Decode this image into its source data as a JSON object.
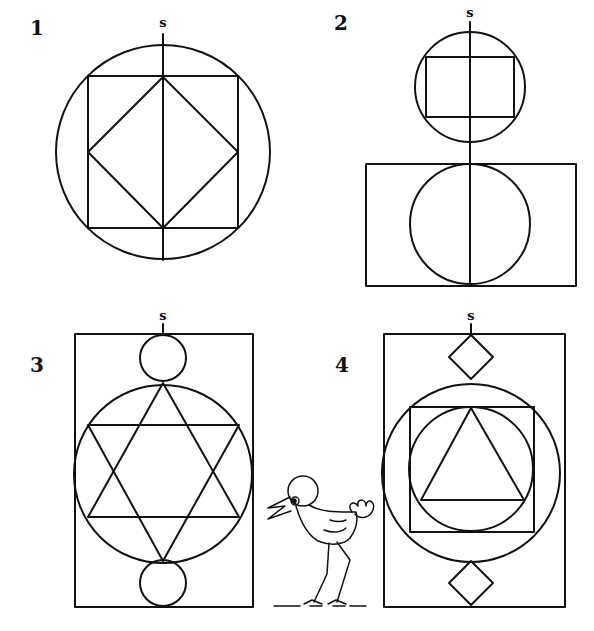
{
  "figures": [
    {
      "number": "1",
      "axis_label": "s",
      "number_pos": [
        30,
        35
      ],
      "s_pos": [
        163,
        27
      ],
      "axis": [
        163,
        34,
        163,
        260
      ],
      "circles": [
        {
          "cx": 163,
          "cy": 152,
          "r": 107
        }
      ],
      "rects": [
        {
          "x": 88,
          "y": 76,
          "w": 150,
          "h": 152
        }
      ],
      "polygons": [
        "163,77 238,152 163,228 88,152"
      ]
    },
    {
      "number": "2",
      "axis_label": "s",
      "number_pos": [
        334,
        30
      ],
      "s_pos": [
        470,
        17
      ],
      "axis": [
        470,
        22,
        470,
        286
      ],
      "circles": [
        {
          "cx": 470,
          "cy": 87,
          "r": 55
        },
        {
          "cx": 470,
          "cy": 224,
          "r": 60
        }
      ],
      "rects": [
        {
          "x": 426,
          "y": 57,
          "w": 88,
          "h": 60
        },
        {
          "x": 366,
          "y": 164,
          "w": 210,
          "h": 122
        }
      ],
      "polygons": []
    },
    {
      "number": "3",
      "axis_label": "s",
      "number_pos": [
        30,
        372
      ],
      "s_pos": [
        163,
        320
      ],
      "axis": [
        163,
        324,
        163,
        334
      ],
      "circles": [
        {
          "cx": 163,
          "cy": 358,
          "r": 23
        },
        {
          "cx": 163,
          "cy": 474,
          "r": 89
        },
        {
          "cx": 163,
          "cy": 583,
          "r": 23
        }
      ],
      "rects": [
        {
          "x": 75,
          "y": 334,
          "w": 178,
          "h": 273
        }
      ],
      "polygons": [
        "163,383 239,517 88,517",
        "163,561 239,425 88,425"
      ]
    },
    {
      "number": "4",
      "axis_label": "s",
      "number_pos": [
        335,
        372
      ],
      "s_pos": [
        471,
        320
      ],
      "axis": [
        471,
        324,
        471,
        334
      ],
      "circles": [
        {
          "cx": 471,
          "cy": 473,
          "r": 89
        },
        {
          "cx": 471,
          "cy": 469,
          "r": 62
        }
      ],
      "rects": [
        {
          "x": 384,
          "y": 334,
          "w": 181,
          "h": 273
        },
        {
          "x": 410,
          "y": 407,
          "w": 124,
          "h": 125
        }
      ],
      "polygons": [
        "471,335 493,357 471,379 449,357",
        "471,561 493,583 471,605 449,583",
        "471,408 524,500 421,500"
      ]
    }
  ],
  "mascot": {
    "name": "bird",
    "head": {
      "cx": 303,
      "cy": 491,
      "r": 16
    },
    "eye": {
      "cx": 296,
      "cy": 501,
      "r": 3.5
    }
  },
  "colors": {
    "ink": "#111111",
    "background": "#ffffff"
  }
}
